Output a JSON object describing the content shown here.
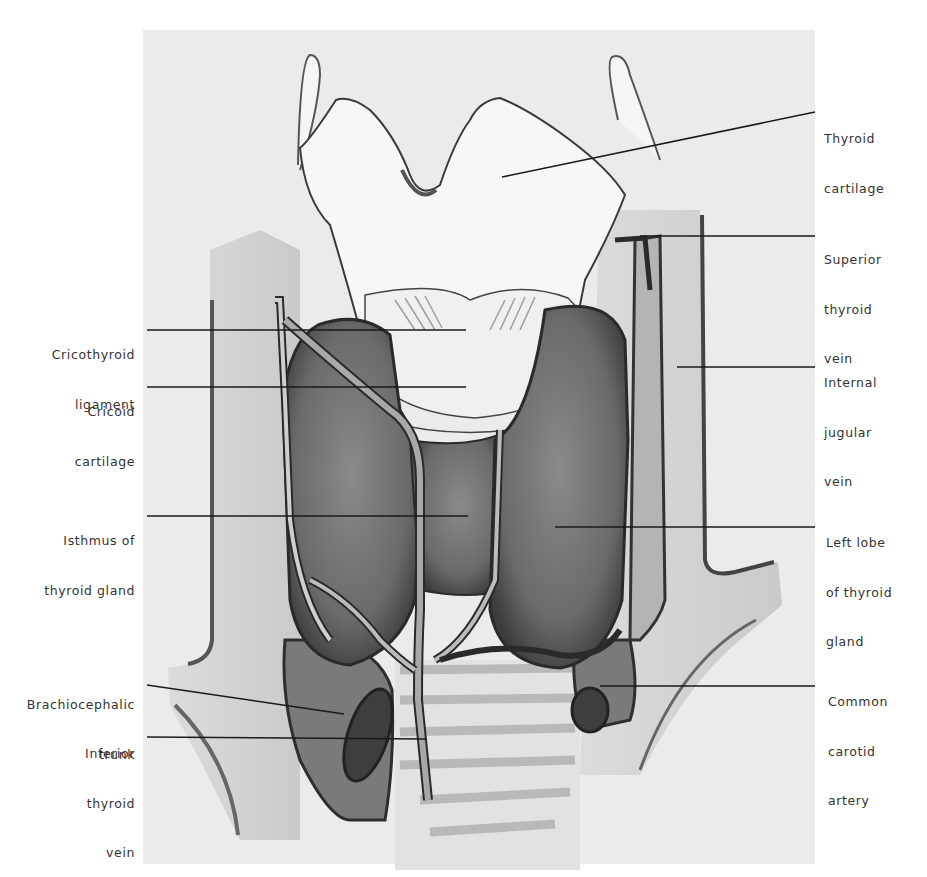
{
  "figure": {
    "colors": {
      "background": "#ffffff",
      "plate": "#ebebeb",
      "gland": "#6e6e6e",
      "vessel_dark": "#3a3a3a",
      "cartilage": "#f4f4f4",
      "leader": "#1a1a1a",
      "label_text": "#333333"
    }
  },
  "labels_right": [
    {
      "id": "thyroid-cartilage",
      "lines": [
        "Thyroid",
        "cartilage"
      ]
    },
    {
      "id": "superior-thyroid-vein",
      "lines": [
        "Superior",
        "thyroid",
        "vein"
      ]
    },
    {
      "id": "internal-jugular-vein",
      "lines": [
        "Internal",
        "jugular",
        "vein"
      ]
    },
    {
      "id": "left-lobe-thyroid",
      "lines": [
        "Left lobe",
        "of thyroid",
        "gland"
      ]
    },
    {
      "id": "common-carotid-artery",
      "lines": [
        "Common",
        "carotid",
        "artery"
      ]
    }
  ],
  "labels_left": [
    {
      "id": "cricothyroid-ligament",
      "lines": [
        "Cricothyroid",
        "ligament"
      ]
    },
    {
      "id": "cricoid-cartilage",
      "lines": [
        "Cricoid",
        "cartilage"
      ]
    },
    {
      "id": "isthmus-thyroid",
      "lines": [
        "Isthmus of",
        "thyroid gland"
      ]
    },
    {
      "id": "brachiocephalic-trunk",
      "lines": [
        "Brachiocephalic",
        "trunk"
      ]
    },
    {
      "id": "inferior-thyroid-vein",
      "lines": [
        "Inferior",
        "thyroid",
        "vein"
      ]
    }
  ]
}
